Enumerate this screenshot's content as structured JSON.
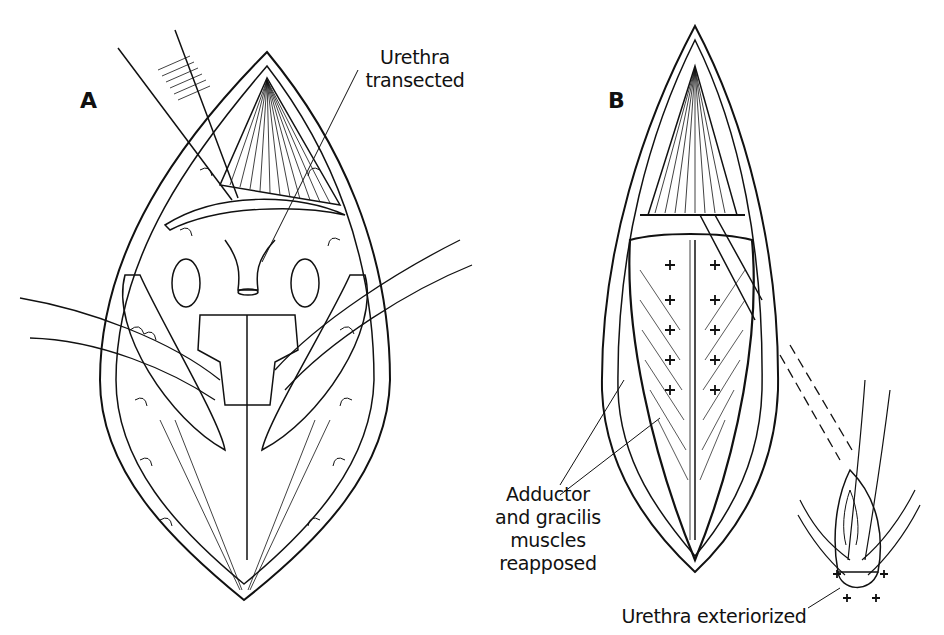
{
  "figure": {
    "panels": [
      {
        "id": "A",
        "letter": "A",
        "labels": [
          {
            "lines": [
              "Urethra",
              "transected"
            ]
          }
        ]
      },
      {
        "id": "B",
        "letter": "B",
        "labels": [
          {
            "lines": [
              "Adductor",
              "and gracilis",
              "muscles",
              "reapposed"
            ]
          },
          {
            "lines": [
              "Urethra exteriorized"
            ]
          }
        ]
      }
    ]
  },
  "colors": {
    "ink": "#111111",
    "background": "#ffffff"
  }
}
